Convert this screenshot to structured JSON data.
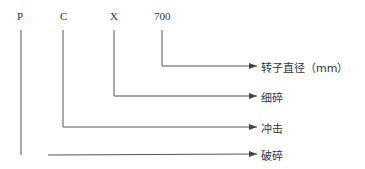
{
  "diagram": {
    "codes": [
      {
        "text": "P",
        "x": 17
      },
      {
        "text": "C",
        "x": 60
      },
      {
        "text": "X",
        "x": 110
      },
      {
        "text": "700",
        "x": 154
      }
    ],
    "labels": [
      {
        "text": "转子直径（mm）",
        "meaning": "rotor diameter (mm)",
        "code": "700"
      },
      {
        "text": "细碎",
        "meaning": "fine crushing",
        "code": "X"
      },
      {
        "text": "冲击",
        "meaning": "impact",
        "code": "C"
      },
      {
        "text": "破碎",
        "meaning": "crushing",
        "code": "P"
      }
    ],
    "line_color": "#555555"
  }
}
